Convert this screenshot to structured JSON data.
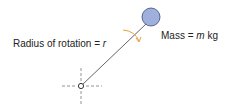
{
  "diagram": {
    "radius_label_prefix": "Radius of rotation = ",
    "radius_symbol": "r",
    "mass_label_prefix": "Mass = ",
    "mass_symbol": "m",
    "mass_unit": " kg",
    "colors": {
      "mass_fill": "#9fb0dc",
      "mass_stroke": "#3a4a7a",
      "arrow": "#e8a040",
      "line": "#555555"
    }
  }
}
